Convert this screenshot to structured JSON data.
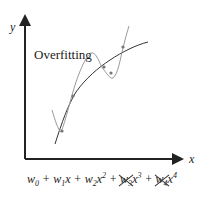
{
  "diagram": {
    "title": "Overfitting",
    "axes": {
      "x_label": "x",
      "y_label": "y"
    },
    "curves": [
      {
        "name": "fit-curve",
        "color": "#333333",
        "description": "smooth underlying fit"
      },
      {
        "name": "overfit-curve",
        "color": "#999999",
        "description": "high-order polynomial overfit"
      }
    ],
    "data_points": [
      {
        "x": 62,
        "y": 131
      },
      {
        "x": 73,
        "y": 96
      },
      {
        "x": 104,
        "y": 67
      },
      {
        "x": 111,
        "y": 73
      },
      {
        "x": 123,
        "y": 47
      }
    ],
    "formula": {
      "terms": [
        {
          "text": "w",
          "sub": "0",
          "sup": "",
          "x": "",
          "struck": false
        },
        {
          "text": "w",
          "sub": "1",
          "sup": "",
          "x": "x",
          "struck": false
        },
        {
          "text": "w",
          "sub": "2",
          "sup": "2",
          "x": "x",
          "struck": false
        },
        {
          "text": "w",
          "sub": "3",
          "sup": "3",
          "x": "x",
          "struck": true
        },
        {
          "text": "w",
          "sub": "4",
          "sup": "4",
          "x": "x",
          "struck": true
        }
      ],
      "plus": "+"
    }
  }
}
